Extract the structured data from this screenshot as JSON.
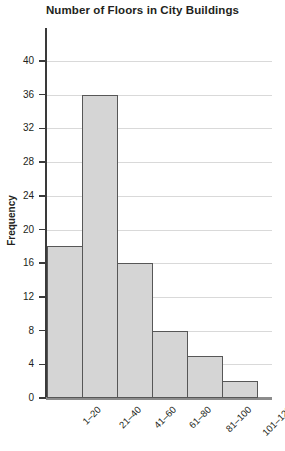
{
  "chart_data": {
    "type": "bar",
    "title": "Number of Floors in City Buildings",
    "xlabel": "",
    "ylabel": "Frequency",
    "categories": [
      "1–20",
      "21–40",
      "41–60",
      "61–80",
      "81–100",
      "101–120"
    ],
    "values": [
      18,
      36,
      16,
      8,
      5,
      2
    ],
    "ylim": [
      0,
      40
    ],
    "yticks": [
      0,
      4,
      8,
      12,
      16,
      20,
      24,
      28,
      32,
      36,
      40
    ],
    "ytick_labels": [
      "0",
      "4",
      "8",
      "12",
      "16",
      "20",
      "24",
      "28",
      "32",
      "36",
      "40"
    ],
    "grid": true,
    "legend": false,
    "colors": {
      "bar_fill": "#d5d5d5",
      "bar_border": "#575757",
      "gridline": "#d9d9d9",
      "axis": "#3a3a3a",
      "text": "#231f20",
      "background": "#ffffff"
    }
  }
}
